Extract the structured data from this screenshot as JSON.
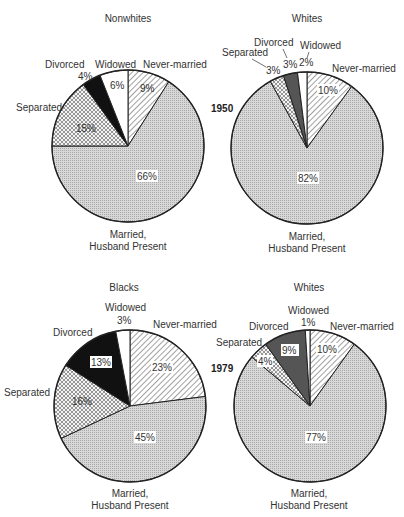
{
  "chart_data": [
    {
      "type": "pie",
      "year": "1950",
      "title": "Nonwhites",
      "labels": [
        "Never-married",
        "Married, Husband Present",
        "Separated",
        "Divorced",
        "Widowed"
      ],
      "values": [
        9,
        66,
        15,
        4,
        6
      ],
      "value_labels": [
        "9%",
        "66%",
        "15%",
        "4%",
        "6%"
      ]
    },
    {
      "type": "pie",
      "year": "1950",
      "title": "Whites",
      "labels": [
        "Never-married",
        "Married, Husband Present",
        "Separated",
        "Divorced",
        "Widowed"
      ],
      "values": [
        10,
        82,
        3,
        3,
        2
      ],
      "value_labels": [
        "10%",
        "82%",
        "3%",
        "3%",
        "2%"
      ]
    },
    {
      "type": "pie",
      "year": "1979",
      "title": "Blacks",
      "labels": [
        "Never-married",
        "Married, Husband Present",
        "Separated",
        "Divorced",
        "Widowed"
      ],
      "values": [
        23,
        45,
        16,
        13,
        3
      ],
      "value_labels": [
        "23%",
        "45%",
        "16%",
        "13%",
        "3%"
      ]
    },
    {
      "type": "pie",
      "year": "1979",
      "title": "Whites",
      "labels": [
        "Never-married",
        "Married, Husband Present",
        "Separated",
        "Divorced",
        "Widowed"
      ],
      "values": [
        10,
        77,
        4,
        9,
        1
      ],
      "value_labels": [
        "10%",
        "77%",
        "4%",
        "9%",
        "1%"
      ]
    }
  ],
  "labels": {
    "year_1950": "1950",
    "year_1979": "1979",
    "married_line1": "Married,",
    "married_line2": "Husband Present",
    "never_married": "Never-married",
    "separated": "Separated",
    "divorced": "Divorced",
    "widowed": "Widowed"
  },
  "colors": {
    "outline": "#222222",
    "married_fill": "#cfcfcf",
    "divorced_fill_dark": "#111111",
    "divorced_fill_mid": "#555555",
    "widowed_fill": "#ffffff"
  }
}
